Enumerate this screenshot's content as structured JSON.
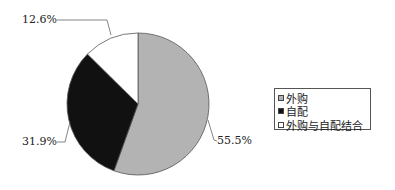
{
  "chart_data": {
    "type": "pie",
    "title": "",
    "categories": [
      "外购",
      "自配",
      "外购与自配结合"
    ],
    "values": [
      55.5,
      31.9,
      12.6
    ],
    "labels": [
      "55.5%",
      "31.9%",
      "12.6%"
    ],
    "colors": [
      "#b3b3b3",
      "#111111",
      "#ffffff"
    ],
    "legend_position": "right",
    "start_angle_deg": 0,
    "direction": "clockwise"
  },
  "legend": {
    "items": [
      {
        "label": "外购",
        "color": "#b3b3b3"
      },
      {
        "label": "自配",
        "color": "#111111"
      },
      {
        "label": "外购与自配结合",
        "color": "#ffffff"
      }
    ]
  },
  "data_labels": {
    "slice1": "55.5%",
    "slice2": "31.9%",
    "slice3": "12.6%"
  }
}
